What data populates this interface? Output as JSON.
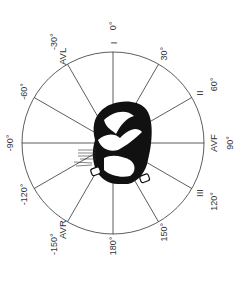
{
  "diagram": {
    "center": [
      113,
      143
    ],
    "radius": 91,
    "rotation_note": "0° axis points up; +90° points right",
    "line_color": "#333333",
    "heart_color": "#111111",
    "spokes_deg": [
      0,
      30,
      60,
      90,
      120,
      150,
      180,
      -150,
      -120,
      -90,
      -60,
      -30
    ],
    "angle_labels": [
      {
        "angle": 0,
        "text": "0°"
      },
      {
        "angle": 30,
        "text": "30°"
      },
      {
        "angle": 60,
        "text": "60°"
      },
      {
        "angle": 90,
        "text": "90°"
      },
      {
        "angle": 120,
        "text": "120°"
      },
      {
        "angle": 150,
        "text": "150°"
      },
      {
        "angle": 180,
        "text": "180°"
      },
      {
        "angle": -150,
        "text": "-150°"
      },
      {
        "angle": -120,
        "text": "-120°"
      },
      {
        "angle": -90,
        "text": "-90°"
      },
      {
        "angle": -60,
        "text": "-60°"
      },
      {
        "angle": -30,
        "text": "-30°"
      }
    ],
    "lead_labels": [
      {
        "angle": 0,
        "text": "I"
      },
      {
        "angle": 60,
        "text": "II"
      },
      {
        "angle": 90,
        "text": "AVF"
      },
      {
        "angle": 120,
        "text": "III"
      },
      {
        "angle": -150,
        "text": "AVR"
      },
      {
        "angle": -30,
        "text": "AVL"
      }
    ]
  }
}
